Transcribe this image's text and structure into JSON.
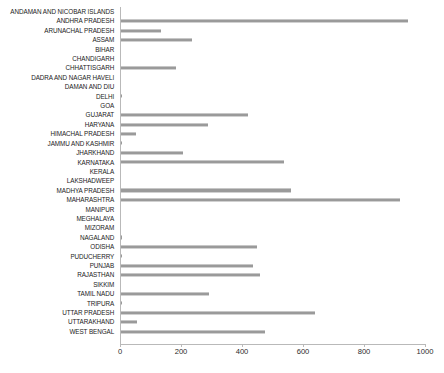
{
  "chart_data": {
    "type": "bar",
    "orientation": "horizontal",
    "title": "",
    "subtitle": "",
    "xlabel": "",
    "ylabel": "",
    "xlim": [
      0,
      1000
    ],
    "xticks": [
      0,
      200,
      400,
      600,
      800,
      1000
    ],
    "xticklabels": [
      "0",
      "200",
      "400",
      "600",
      "800",
      "1000"
    ],
    "grid": false,
    "legend": false,
    "bar_color": "#9a9a9a",
    "axis_color": "#b9b9b9",
    "label_color": "#1a1a1a",
    "categories": [
      "ANDAMAN AND NICOBAR ISLANDS",
      "ANDHRA PRADESH",
      "ARUNACHAL PRADESH",
      "ASSAM",
      "BIHAR",
      "CHANDIGARH",
      "CHHATTISGARH",
      "DADRA AND NAGAR HAVELI",
      "DAMAN AND DIU",
      "DELHI",
      "GOA",
      "GUJARAT",
      "HARYANA",
      "HIMACHAL PRADESH",
      "JAMMU AND KASHMIR",
      "JHARKHAND",
      "KARNATAKA",
      "KERALA",
      "LAKSHADWEEP",
      "MADHYA PRADESH",
      "MAHARASHTRA",
      "MANIPUR",
      "MEGHALAYA",
      "MIZORAM",
      "NAGALAND",
      "ODISHA",
      "PUDUCHERRY",
      "PUNJAB",
      "RAJASTHAN",
      "SIKKIM",
      "TAMIL NADU",
      "TRIPURA",
      "UTTAR PRADESH",
      "UTTARAKHAND",
      "WEST BENGAL"
    ],
    "values": [
      0,
      944,
      135,
      236,
      0,
      0,
      184,
      0,
      0,
      6,
      3,
      420,
      289,
      53,
      5,
      207,
      538,
      0,
      0,
      561,
      918,
      0,
      0,
      0,
      7,
      449,
      6,
      436,
      458,
      0,
      292,
      6,
      639,
      57,
      475
    ]
  }
}
